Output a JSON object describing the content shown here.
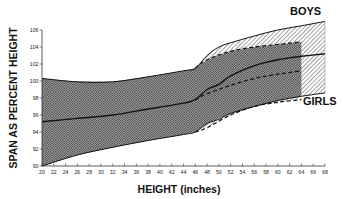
{
  "chart_data": {
    "type": "area",
    "title": "",
    "xlabel": "HEIGHT (inches)",
    "ylabel": "SPAN AS PERCENT HEIGHT",
    "xlim": [
      20,
      68
    ],
    "ylim": [
      90,
      106
    ],
    "x_ticks": [
      20,
      22,
      24,
      26,
      28,
      30,
      32,
      34,
      36,
      38,
      40,
      42,
      44,
      46,
      48,
      50,
      52,
      54,
      56,
      58,
      60,
      62,
      64,
      66,
      68
    ],
    "y_ticks": [
      90,
      92,
      94,
      96,
      98,
      100,
      102,
      104,
      106
    ],
    "grid": false,
    "legend": "direct labels",
    "annotations": [
      "BOYS",
      "GIRLS"
    ],
    "series": [
      {
        "name": "BOYS",
        "style": "solid, hatched band",
        "x": [
          20,
          26,
          32,
          38,
          44,
          46,
          48,
          50,
          52,
          56,
          60,
          64,
          68
        ],
        "upper": [
          100.3,
          99.9,
          99.9,
          100.5,
          101.2,
          101.5,
          103.0,
          104.0,
          104.5,
          105.3,
          106.0,
          106.5,
          107.0
        ],
        "mean": [
          95.2,
          95.6,
          96.0,
          96.7,
          97.4,
          97.8,
          99.0,
          99.6,
          100.6,
          101.8,
          102.5,
          102.9,
          103.2
        ],
        "lower": [
          90.0,
          91.3,
          92.2,
          93.0,
          93.7,
          94.0,
          95.0,
          95.5,
          96.2,
          97.0,
          97.7,
          98.2,
          98.6
        ]
      },
      {
        "name": "GIRLS",
        "style": "dashed, crosshatched band",
        "x": [
          20,
          26,
          32,
          38,
          44,
          46,
          48,
          52,
          56,
          60,
          64
        ],
        "upper": [
          100.3,
          99.9,
          99.9,
          100.5,
          101.2,
          101.5,
          102.5,
          103.5,
          104.0,
          104.3,
          104.6
        ],
        "mean": [
          95.2,
          95.6,
          96.0,
          96.7,
          97.4,
          97.8,
          98.5,
          99.5,
          100.3,
          100.8,
          101.2
        ],
        "lower": [
          90.0,
          91.3,
          92.2,
          93.0,
          93.7,
          94.0,
          94.5,
          96.0,
          97.0,
          97.5,
          97.8
        ]
      }
    ]
  },
  "labels": {
    "boys": "BOYS",
    "girls": "GIRLS",
    "xlabel": "HEIGHT (inches)",
    "ylabel": "SPAN AS PERCENT HEIGHT"
  },
  "colors": {
    "ink": "#111111",
    "background": "#ffffff"
  }
}
